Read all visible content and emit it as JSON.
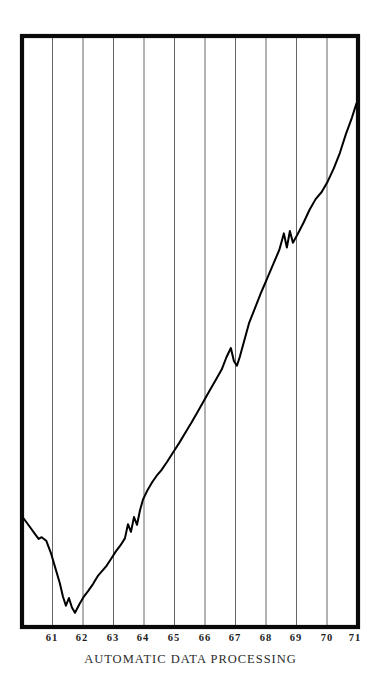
{
  "figure": {
    "caption": "AUTOMATIC DATA PROCESSING",
    "frame_color": "#000000",
    "grid_color": "#555555",
    "line_color": "#000000",
    "background_color": "#ffffff"
  },
  "chart_data": {
    "type": "line",
    "title": "AUTOMATIC DATA PROCESSING",
    "xlabel": "",
    "ylabel": "",
    "grid": true,
    "gridlines": "vertical only, one per year tick",
    "legend": "none",
    "axis_scale": "logarithmic (unlabeled price scale)",
    "y_axis_labeled": false,
    "xlim": [
      60.5,
      71.6
    ],
    "ylim": [
      0,
      100
    ],
    "tick_labels": [
      "61",
      "62",
      "63",
      "64",
      "65",
      "66",
      "67",
      "68",
      "69",
      "70",
      "71"
    ],
    "tick_x_values": [
      61,
      62,
      63,
      64,
      65,
      66,
      67,
      68,
      69,
      70,
      71
    ],
    "series": [
      {
        "name": "AUTOMATIC DATA PROCESSING",
        "x": [
          60.55,
          60.75,
          60.95,
          61.05,
          61.15,
          61.3,
          61.45,
          61.6,
          61.75,
          61.85,
          61.95,
          62.05,
          62.15,
          62.25,
          62.4,
          62.55,
          62.7,
          62.85,
          63.0,
          63.15,
          63.3,
          63.45,
          63.6,
          63.75,
          63.9,
          64.0,
          64.1,
          64.2,
          64.3,
          64.4,
          64.5,
          64.65,
          64.8,
          64.95,
          65.1,
          65.3,
          65.5,
          65.7,
          65.9,
          66.1,
          66.3,
          66.5,
          66.7,
          66.9,
          67.1,
          67.25,
          67.4,
          67.5,
          67.6,
          67.7,
          67.85,
          68.0,
          68.2,
          68.4,
          68.6,
          68.8,
          69.0,
          69.15,
          69.25,
          69.35,
          69.45,
          69.6,
          69.8,
          70.0,
          70.2,
          70.4,
          70.6,
          70.8,
          71.0,
          71.2,
          71.4,
          71.55
        ],
        "y": [
          18.4,
          17.0,
          15.6,
          14.9,
          15.2,
          14.6,
          12.6,
          10.0,
          7.4,
          5.2,
          3.6,
          4.9,
          3.3,
          2.4,
          3.9,
          5.2,
          6.2,
          7.3,
          8.6,
          9.5,
          10.4,
          11.6,
          12.8,
          13.8,
          15.0,
          17.4,
          16.1,
          18.6,
          17.3,
          19.8,
          21.6,
          23.2,
          24.5,
          25.6,
          26.5,
          28.0,
          29.6,
          31.2,
          32.9,
          34.6,
          36.4,
          38.2,
          40.0,
          41.8,
          43.6,
          45.6,
          47.2,
          45.0,
          44.2,
          45.8,
          48.6,
          51.4,
          54.0,
          56.6,
          59.0,
          61.4,
          63.8,
          66.6,
          64.2,
          67.0,
          65.0,
          66.4,
          68.4,
          70.6,
          72.4,
          73.6,
          75.4,
          77.6,
          80.2,
          83.4,
          86.2,
          88.6
        ]
      }
    ]
  },
  "xaxis": {
    "ticks": [
      {
        "label": "61",
        "x_px": 52
      },
      {
        "label": "62",
        "x_px": 82
      },
      {
        "label": "63",
        "x_px": 113
      },
      {
        "label": "64",
        "x_px": 143
      },
      {
        "label": "65",
        "x_px": 174
      },
      {
        "label": "66",
        "x_px": 205
      },
      {
        "label": "67",
        "x_px": 235
      },
      {
        "label": "68",
        "x_px": 266
      },
      {
        "label": "69",
        "x_px": 296
      },
      {
        "label": "70",
        "x_px": 327
      },
      {
        "label": "71",
        "x_px": 355
      }
    ]
  }
}
